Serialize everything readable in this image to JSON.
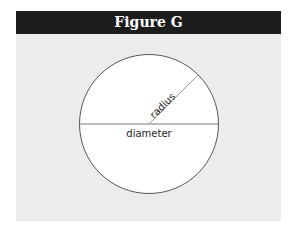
{
  "figure": {
    "title": "Figure G",
    "header_color": "#1c1c1c",
    "background_color": "#ececec",
    "circle": {
      "fill": "#ffffff",
      "stroke": "#555555"
    },
    "labels": {
      "radius": "radius",
      "diameter": "diameter"
    }
  }
}
